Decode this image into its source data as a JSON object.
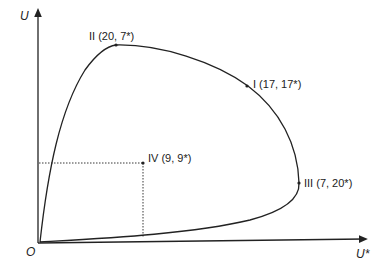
{
  "diagram": {
    "type": "utility-possibility-frontier",
    "axes": {
      "y_label": "U",
      "x_label": "U*",
      "origin_label": "O"
    },
    "points": [
      {
        "id": "II",
        "label": "II (20, 7*)",
        "u": 20,
        "u_star": 7
      },
      {
        "id": "I",
        "label": "I (17, 17*)",
        "u": 17,
        "u_star": 17
      },
      {
        "id": "III",
        "label": "III (7, 20*)",
        "u": 7,
        "u_star": 20
      },
      {
        "id": "IV",
        "label": "IV (9, 9*)",
        "u": 9,
        "u_star": 9
      }
    ],
    "colors": {
      "line": "#222222",
      "background": "#ffffff"
    }
  }
}
